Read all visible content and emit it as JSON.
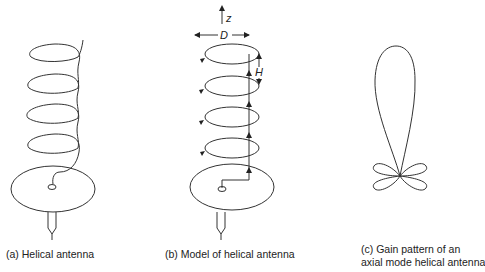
{
  "panels": [
    {
      "id": "a",
      "caption": "(a)  Helical antenna"
    },
    {
      "id": "b",
      "caption": "(b) Model of helical antenna",
      "labels": {
        "axis": "z",
        "diameter": "D",
        "spacing": "H"
      }
    },
    {
      "id": "c",
      "caption_line1": "(c) Gain pattern of an",
      "caption_line2": "axial mode helical antenna"
    }
  ],
  "colors": {
    "stroke": "#333333",
    "text": "#222222"
  }
}
